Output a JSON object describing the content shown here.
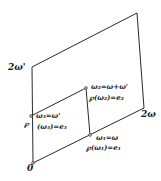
{
  "diagram": {
    "title": "",
    "vertices": {
      "origin": {
        "label": "0",
        "x": 33,
        "y": 163
      },
      "two_omega": {
        "label": "2ω",
        "x": 144,
        "y": 108
      },
      "two_omega_prime": {
        "label": "2ω'",
        "x": 32,
        "y": 67
      },
      "far_corner": {
        "label": "",
        "x": 137,
        "y": 13
      }
    },
    "half_points": {
      "omega1": {
        "x": 90,
        "y": 135,
        "line1": "ω₁=ω",
        "line2": "℘(ω₁)=e₁"
      },
      "omega2": {
        "x": 86,
        "y": 88,
        "line1": "ω₂=ω+ω'",
        "line2": "℘(ω₂)=e₂"
      },
      "omega3": {
        "x": 31,
        "y": 116,
        "line1": "ω₃=ω'",
        "line2a": "℘",
        "line2b": "(ω₃)=e₃"
      }
    },
    "colors": {
      "line": "#2a2a2a",
      "text": "#1a1a1a",
      "background": "#ffffff"
    }
  }
}
